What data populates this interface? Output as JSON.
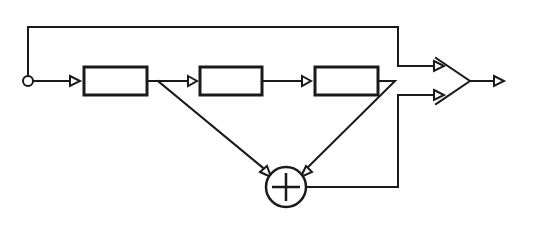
{
  "diagram": {
    "type": "block-diagram",
    "colors": {
      "stroke": "#1a1a1a",
      "background": "#ffffff"
    },
    "nodes": [
      {
        "id": "input",
        "kind": "input-node",
        "label": ""
      },
      {
        "id": "block1",
        "kind": "block",
        "label": ""
      },
      {
        "id": "block2",
        "kind": "block",
        "label": ""
      },
      {
        "id": "block3",
        "kind": "block",
        "label": ""
      },
      {
        "id": "sum",
        "kind": "summing-junction",
        "symbol": "+"
      },
      {
        "id": "amp",
        "kind": "two-input-amplifier",
        "label": ""
      },
      {
        "id": "output",
        "kind": "output-arrow",
        "label": ""
      }
    ],
    "edges": [
      {
        "from": "input",
        "to": "block1"
      },
      {
        "from": "block1",
        "to": "block2"
      },
      {
        "from": "block2",
        "to": "block3"
      },
      {
        "from": "block1",
        "to": "sum"
      },
      {
        "from": "block3",
        "to": "sum"
      },
      {
        "from": "input",
        "to": "amp",
        "port": "upper",
        "route": "top-bypass"
      },
      {
        "from": "sum",
        "to": "amp",
        "port": "lower"
      },
      {
        "from": "amp",
        "to": "output"
      }
    ]
  }
}
